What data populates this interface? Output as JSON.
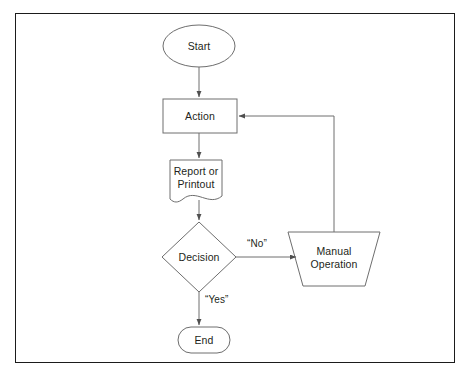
{
  "diagram": {
    "frame": {
      "border_color": "#1b1b1b",
      "background": "#ffffff"
    },
    "stroke_color": "#6e6e6e",
    "text_color": "#231f20",
    "nodes": [
      {
        "id": "start",
        "shape": "ellipse",
        "label": "Start"
      },
      {
        "id": "action",
        "shape": "rectangle",
        "label": "Action"
      },
      {
        "id": "report",
        "shape": "document",
        "label": "Report or\nPrintout"
      },
      {
        "id": "decision",
        "shape": "diamond",
        "label": "Decision"
      },
      {
        "id": "manual",
        "shape": "trapezoid",
        "label": "Manual\nOperation"
      },
      {
        "id": "end",
        "shape": "stadium",
        "label": "End"
      }
    ],
    "edges": [
      {
        "from": "start",
        "to": "action",
        "label": ""
      },
      {
        "from": "action",
        "to": "report",
        "label": ""
      },
      {
        "from": "report",
        "to": "decision",
        "label": ""
      },
      {
        "from": "decision",
        "to": "manual",
        "label": "“No”"
      },
      {
        "from": "decision",
        "to": "end",
        "label": "“Yes”"
      },
      {
        "from": "manual",
        "to": "action",
        "label": ""
      }
    ]
  }
}
